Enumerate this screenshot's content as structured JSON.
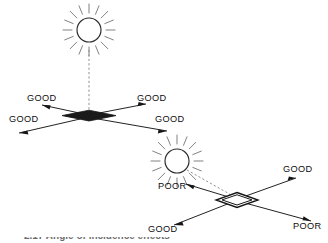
{
  "figure": {
    "background_color": "#ffffff",
    "line_color": "#161616",
    "ray_color": "#6b6b6b",
    "dash_color": "#8a8a8a",
    "label_color": "#0d0d0d"
  },
  "panels": [
    {
      "id": "top-panel",
      "name": "overhead-sun-panel",
      "sun": {
        "icon": "sun-icon",
        "center_x": 89,
        "center_y": 30,
        "radius": 12,
        "ray_count": 16
      },
      "sunbeam": {
        "icon": "dashed-beam-icon",
        "style": "dashed",
        "from_x": 89,
        "from_y": 46,
        "to_x": 89,
        "to_y": 110
      },
      "surface": {
        "name": "horizontal-surface-diamond",
        "fill": "dark",
        "center_x": 89,
        "center_y": 116
      },
      "arrows": [
        {
          "label": "GOOD",
          "direction": "upper-left",
          "label_x": 27,
          "label_y": 101
        },
        {
          "label": "GOOD",
          "direction": "upper-right",
          "label_x": 137,
          "label_y": 101
        },
        {
          "label": "GOOD",
          "direction": "lower-left",
          "label_x": 9,
          "label_y": 122
        },
        {
          "label": "GOOD",
          "direction": "lower-right",
          "label_x": 155,
          "label_y": 122
        }
      ]
    },
    {
      "id": "bottom-panel",
      "name": "low-sun-panel",
      "sun": {
        "icon": "sun-icon",
        "center_x": 177,
        "center_y": 161,
        "radius": 12,
        "ray_count": 16
      },
      "sunbeam": {
        "icon": "dashed-beam-icon",
        "style": "dashed",
        "from_x": 188,
        "from_y": 172,
        "to_x": 234,
        "to_y": 196
      },
      "surface": {
        "name": "tilted-surface-diamond",
        "fill": "open",
        "center_x": 237,
        "center_y": 200
      },
      "arrows": [
        {
          "label": "POOR",
          "direction": "upper-left",
          "label_x": 158,
          "label_y": 189
        },
        {
          "label": "GOOD",
          "direction": "upper-right",
          "label_x": 283,
          "label_y": 172
        },
        {
          "label": "GOOD",
          "direction": "lower-left",
          "label_x": 148,
          "label_y": 232
        },
        {
          "label": "POOR",
          "direction": "lower-right",
          "label_x": 293,
          "label_y": 229
        }
      ]
    }
  ],
  "caption": {
    "text": "2.17 Angle of incidence effects",
    "visible": "partially-cropped"
  }
}
